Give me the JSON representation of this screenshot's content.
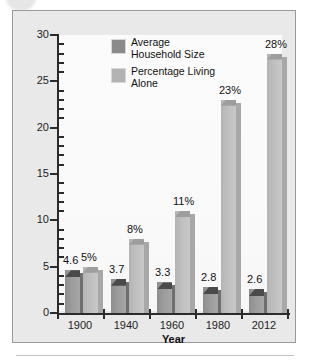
{
  "chart_data": {
    "type": "bar",
    "title": "",
    "xlabel": "Year",
    "ylabel": "",
    "ylim": [
      0,
      30
    ],
    "yticks": [
      0,
      5,
      10,
      15,
      20,
      25,
      30
    ],
    "minor_ticks": true,
    "grid": false,
    "legend_position": "top-center",
    "categories": [
      "1900",
      "1940",
      "1960",
      "1980",
      "2012"
    ],
    "series": [
      {
        "name": "Average Household Size",
        "color": "#9c9c9c",
        "values": [
          4.6,
          3.7,
          3.3,
          2.8,
          2.6
        ],
        "labels": [
          "4.6",
          "3.7",
          "3.3",
          "2.8",
          "2.6"
        ]
      },
      {
        "name": "Percentage Living Alone",
        "color": "#bfbfbf",
        "values": [
          5,
          8,
          11,
          23,
          28
        ],
        "labels": [
          "5%",
          "8%",
          "11%",
          "23%",
          "28%"
        ]
      }
    ]
  },
  "axis": {
    "y_labels": [
      "30",
      "25",
      "20",
      "15",
      "10",
      "5",
      "0"
    ],
    "x_labels": [
      "1900",
      "1940",
      "1960",
      "1980",
      "2012"
    ],
    "x_title": "Year"
  },
  "legend": {
    "items": [
      {
        "label": "Average\nHousehold Size",
        "swatch": "dark"
      },
      {
        "label": "Percentage Living\nAlone",
        "swatch": "light"
      }
    ]
  },
  "colors": {
    "frame_border": "#9a9a9a",
    "frame_bg": "#e9e9e9",
    "plot_bg": "#fafafa",
    "axis": "#2b2b2b",
    "bar_dark": "#9c9c9c",
    "bar_dark_top": "#4a4a4a",
    "bar_light": "#bfbfbf",
    "bar_light_top": "#9e9e9e",
    "text": "#111111"
  }
}
